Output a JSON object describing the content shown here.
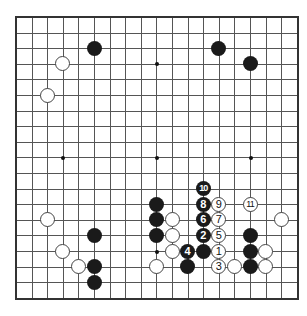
{
  "board": {
    "size": 19,
    "origin_x": 16,
    "origin_y": 17,
    "spacing": 15.6,
    "line_color": "#555555",
    "border_color": "#333333",
    "hoshi": [
      [
        3,
        9
      ],
      [
        9,
        3
      ],
      [
        9,
        9
      ],
      [
        15,
        9
      ],
      [
        9,
        15
      ]
    ],
    "stones": [
      {
        "col": 5,
        "row": 2,
        "color": "black",
        "label": ""
      },
      {
        "col": 3,
        "row": 3,
        "color": "white",
        "label": ""
      },
      {
        "col": 2,
        "row": 5,
        "color": "white",
        "label": ""
      },
      {
        "col": 13,
        "row": 2,
        "color": "black",
        "label": ""
      },
      {
        "col": 15,
        "row": 3,
        "color": "black",
        "label": ""
      },
      {
        "col": 12,
        "row": 11,
        "color": "black",
        "label": "10"
      },
      {
        "col": 12,
        "row": 12,
        "color": "black",
        "label": "8"
      },
      {
        "col": 13,
        "row": 12,
        "color": "white",
        "label": "9"
      },
      {
        "col": 15,
        "row": 12,
        "color": "white",
        "label": "11"
      },
      {
        "col": 12,
        "row": 13,
        "color": "black",
        "label": "6"
      },
      {
        "col": 13,
        "row": 13,
        "color": "white",
        "label": "7"
      },
      {
        "col": 12,
        "row": 14,
        "color": "black",
        "label": "2"
      },
      {
        "col": 13,
        "row": 14,
        "color": "white",
        "label": "5"
      },
      {
        "col": 11,
        "row": 15,
        "color": "black",
        "label": "4"
      },
      {
        "col": 12,
        "row": 15,
        "color": "black",
        "label": ""
      },
      {
        "col": 13,
        "row": 15,
        "color": "white",
        "label": "1"
      },
      {
        "col": 11,
        "row": 16,
        "color": "black",
        "label": ""
      },
      {
        "col": 13,
        "row": 16,
        "color": "white",
        "label": "3"
      },
      {
        "col": 14,
        "row": 16,
        "color": "white",
        "label": ""
      },
      {
        "col": 9,
        "row": 12,
        "color": "black",
        "label": ""
      },
      {
        "col": 9,
        "row": 13,
        "color": "black",
        "label": ""
      },
      {
        "col": 9,
        "row": 14,
        "color": "black",
        "label": ""
      },
      {
        "col": 10,
        "row": 13,
        "color": "white",
        "label": ""
      },
      {
        "col": 10,
        "row": 14,
        "color": "white",
        "label": ""
      },
      {
        "col": 10,
        "row": 15,
        "color": "white",
        "label": ""
      },
      {
        "col": 9,
        "row": 16,
        "color": "white",
        "label": ""
      },
      {
        "col": 15,
        "row": 14,
        "color": "black",
        "label": ""
      },
      {
        "col": 15,
        "row": 15,
        "color": "black",
        "label": ""
      },
      {
        "col": 15,
        "row": 16,
        "color": "black",
        "label": ""
      },
      {
        "col": 16,
        "row": 15,
        "color": "white",
        "label": ""
      },
      {
        "col": 16,
        "row": 16,
        "color": "white",
        "label": ""
      },
      {
        "col": 17,
        "row": 13,
        "color": "white",
        "label": ""
      },
      {
        "col": 2,
        "row": 13,
        "color": "white",
        "label": ""
      },
      {
        "col": 5,
        "row": 14,
        "color": "black",
        "label": ""
      },
      {
        "col": 3,
        "row": 15,
        "color": "white",
        "label": ""
      },
      {
        "col": 4,
        "row": 16,
        "color": "white",
        "label": ""
      },
      {
        "col": 5,
        "row": 16,
        "color": "black",
        "label": ""
      },
      {
        "col": 5,
        "row": 17,
        "color": "black",
        "label": ""
      }
    ]
  }
}
